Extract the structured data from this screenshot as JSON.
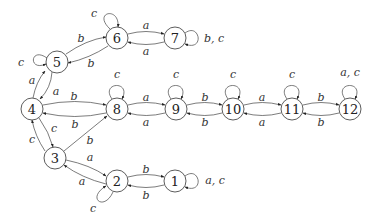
{
  "diagram": {
    "type": "state-transition-graph",
    "nodes": [
      {
        "id": "1",
        "label": "1",
        "x": 175,
        "y": 181
      },
      {
        "id": "2",
        "label": "2",
        "x": 117,
        "y": 181
      },
      {
        "id": "3",
        "label": "3",
        "x": 55,
        "y": 158
      },
      {
        "id": "4",
        "label": "4",
        "x": 32,
        "y": 109
      },
      {
        "id": "5",
        "label": "5",
        "x": 57,
        "y": 62
      },
      {
        "id": "6",
        "label": "6",
        "x": 117,
        "y": 38
      },
      {
        "id": "7",
        "label": "7",
        "x": 175,
        "y": 38
      },
      {
        "id": "8",
        "label": "8",
        "x": 117,
        "y": 109
      },
      {
        "id": "9",
        "label": "9",
        "x": 176,
        "y": 109
      },
      {
        "id": "10",
        "label": "10",
        "x": 233,
        "y": 109
      },
      {
        "id": "11",
        "label": "11",
        "x": 292,
        "y": 109
      },
      {
        "id": "12",
        "label": "12",
        "x": 350,
        "y": 109
      }
    ],
    "edges": [
      {
        "from": "6",
        "to": "7",
        "label": "a"
      },
      {
        "from": "7",
        "to": "6",
        "label": "a"
      },
      {
        "from": "7",
        "to": "7",
        "label": "b, c"
      },
      {
        "from": "6",
        "to": "6",
        "label": "c"
      },
      {
        "from": "5",
        "to": "6",
        "label": "b"
      },
      {
        "from": "6",
        "to": "5",
        "label": "b"
      },
      {
        "from": "5",
        "to": "5",
        "label": "c"
      },
      {
        "from": "4",
        "to": "5",
        "label": "a"
      },
      {
        "from": "5",
        "to": "4",
        "label": "a"
      },
      {
        "from": "4",
        "to": "8",
        "label": "b"
      },
      {
        "from": "8",
        "to": "4",
        "label": "b"
      },
      {
        "from": "8",
        "to": "8",
        "label": "c"
      },
      {
        "from": "8",
        "to": "9",
        "label": "a"
      },
      {
        "from": "9",
        "to": "8",
        "label": "a"
      },
      {
        "from": "9",
        "to": "9",
        "label": "c"
      },
      {
        "from": "9",
        "to": "10",
        "label": "b"
      },
      {
        "from": "10",
        "to": "9",
        "label": "b"
      },
      {
        "from": "10",
        "to": "10",
        "label": "c"
      },
      {
        "from": "10",
        "to": "11",
        "label": "a"
      },
      {
        "from": "11",
        "to": "10",
        "label": "a"
      },
      {
        "from": "11",
        "to": "11",
        "label": "c"
      },
      {
        "from": "11",
        "to": "12",
        "label": "b"
      },
      {
        "from": "12",
        "to": "11",
        "label": "b"
      },
      {
        "from": "12",
        "to": "12",
        "label": "a, c"
      },
      {
        "from": "4",
        "to": "3",
        "label": "c"
      },
      {
        "from": "3",
        "to": "4",
        "label": "c"
      },
      {
        "from": "3",
        "to": "8",
        "label": "b"
      },
      {
        "from": "3",
        "to": "2",
        "label": "a"
      },
      {
        "from": "2",
        "to": "3",
        "label": "a"
      },
      {
        "from": "2",
        "to": "2",
        "label": "c"
      },
      {
        "from": "2",
        "to": "1",
        "label": "b"
      },
      {
        "from": "1",
        "to": "2",
        "label": "b"
      },
      {
        "from": "1",
        "to": "1",
        "label": "a, c"
      }
    ]
  }
}
